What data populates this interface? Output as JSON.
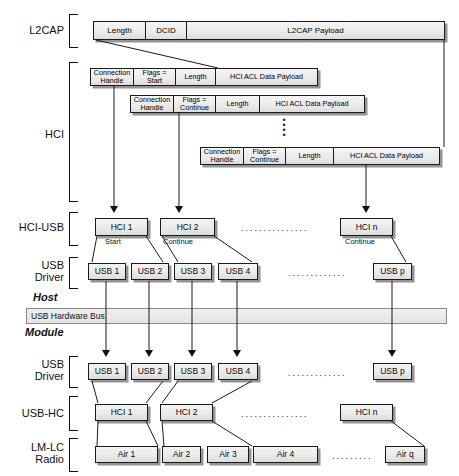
{
  "diagram": {
    "layer_labels": {
      "l2cap": "L2CAP",
      "hci": "HCI",
      "hci_usb": "HCI-USB",
      "usb_driver_host": "USB\nDriver",
      "usb_driver_module": "USB\nDriver",
      "usb_hc": "USB-HC",
      "lm_lc_radio": "LM-LC\nRadio"
    },
    "boundary_labels": {
      "host": "Host",
      "module": "Module"
    },
    "bus": {
      "label": "USB Hardware Bus"
    },
    "l2cap_packet": {
      "cells": [
        "Length",
        "DCID",
        "L2CAP Payload"
      ]
    },
    "hci_packets": [
      {
        "cells": [
          "Connection\nHandle",
          "Flags =\nStart",
          "Length",
          "HCI ACL Data Payload"
        ]
      },
      {
        "cells": [
          "Connection\nHandle",
          "Flags =\nContinue",
          "Length",
          "HCI ACL Data Payload"
        ]
      },
      {
        "cells": [
          "Connection\nHandle",
          "Flags =\nContinue",
          "Length",
          "HCI ACL Data Payload"
        ]
      }
    ],
    "hci_usb_row": {
      "boxes": [
        {
          "label": "HCI 1",
          "note": "Start"
        },
        {
          "label": "HCI 2",
          "note": "Continue"
        },
        {
          "label": "HCI n",
          "note": "Continue"
        }
      ],
      "ellipsis": "..............."
    },
    "usb_driver_host_row": {
      "boxes": [
        "USB 1",
        "USB 2",
        "USB 3",
        "USB 4",
        "USB p"
      ],
      "ellipsis": "............."
    },
    "usb_driver_module_row": {
      "boxes": [
        "USB 1",
        "USB 2",
        "USB 3",
        "USB 4",
        "USB p"
      ],
      "ellipsis": "............."
    },
    "usb_hc_row": {
      "boxes": [
        "HCI 1",
        "HCI 2",
        "HCI n"
      ],
      "ellipsis": "..............."
    },
    "radio_row": {
      "boxes": [
        "Air 1",
        "Air 2",
        "Air 3",
        "Air 4",
        "Air q"
      ],
      "ellipsis": "........."
    },
    "vertical_ellipsis": "⋮"
  }
}
